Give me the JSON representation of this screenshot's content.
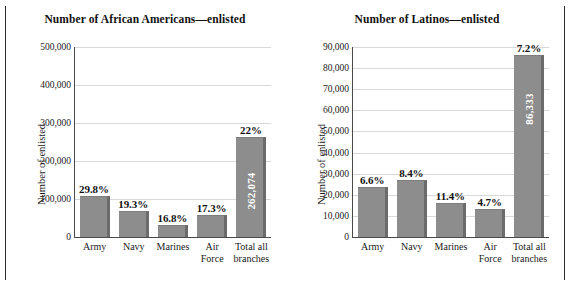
{
  "figure": {
    "background": "#ffffff",
    "bar_color": "#8d8d8d",
    "bar_shadow_color": "#6b6b6b",
    "grid_color": "#d9d9d9",
    "axis_color": "#4a4a4a"
  },
  "chart_data": [
    {
      "type": "bar",
      "title": "Number of African Americans—enlisted",
      "xlabel": "",
      "ylabel": "Number of enlisted",
      "categories": [
        "Army",
        "Navy",
        "Marines",
        "Air Force",
        "Total all branches"
      ],
      "category_lines": [
        [
          "Army"
        ],
        [
          "Navy"
        ],
        [
          "Marines"
        ],
        [
          "Air",
          "Force"
        ],
        [
          "Total all",
          "branches"
        ]
      ],
      "values": [
        108000,
        68000,
        31000,
        57000,
        262074
      ],
      "value_labels": [
        "",
        "",
        "",
        "",
        "262,074"
      ],
      "data_labels": [
        "29.8%",
        "19.3%",
        "16.8%",
        "17.3%",
        "22%"
      ],
      "ylim": [
        0,
        500000
      ],
      "ytick_values": [
        0,
        100000,
        200000,
        300000,
        400000,
        500000
      ],
      "ytick_labels": [
        "0",
        "100,000",
        "200,000",
        "300,000",
        "400,000",
        "500,000"
      ],
      "grid": true,
      "legend": "none"
    },
    {
      "type": "bar",
      "title": "Number of Latinos—enlisted",
      "xlabel": "",
      "ylabel": "Number of enlisted",
      "categories": [
        "Army",
        "Navy",
        "Marines",
        "Air Force",
        "Total all branches"
      ],
      "category_lines": [
        [
          "Army"
        ],
        [
          "Navy"
        ],
        [
          "Marines"
        ],
        [
          "Air",
          "Force"
        ],
        [
          "Total all",
          "branches"
        ]
      ],
      "values": [
        23500,
        26800,
        16100,
        13400,
        86333
      ],
      "value_labels": [
        "",
        "",
        "",
        "",
        "86,333"
      ],
      "data_labels": [
        "6.6%",
        "8.4%",
        "11.4%",
        "4.7%",
        "7.2%"
      ],
      "ylim": [
        0,
        90000
      ],
      "ytick_values": [
        0,
        10000,
        20000,
        30000,
        40000,
        50000,
        60000,
        70000,
        80000,
        90000
      ],
      "ytick_labels": [
        "0",
        "10,000",
        "20,000",
        "30,000",
        "40,000",
        "50,000",
        "60,000",
        "70,000",
        "80,000",
        "90,000"
      ],
      "grid": true,
      "legend": "none"
    }
  ]
}
